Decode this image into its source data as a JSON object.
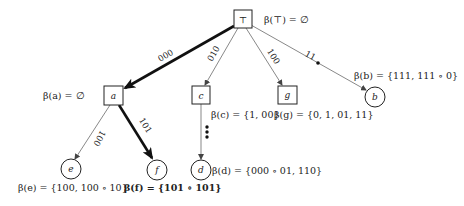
{
  "diagram": {
    "type": "tree",
    "colors": {
      "stroke": "#222222",
      "thin_edge": "#555555",
      "background": "#ffffff"
    },
    "nodes": [
      {
        "id": "top",
        "label": "⊤",
        "shape": "square",
        "annotation": "β(⊤) = ∅"
      },
      {
        "id": "a",
        "label": "a",
        "shape": "square",
        "annotation": "β(a) = ∅"
      },
      {
        "id": "c",
        "label": "c",
        "shape": "square",
        "annotation": "β(c) = {1, 00}"
      },
      {
        "id": "g",
        "label": "g",
        "shape": "square",
        "annotation": "β(g) = {0, 1, 01, 11}"
      },
      {
        "id": "b",
        "label": "b",
        "shape": "circle",
        "annotation": "β(b) = {111, 111 ∘ 0}"
      },
      {
        "id": "e",
        "label": "e",
        "shape": "circle",
        "annotation": "β(e) = {100, 100 ∘ 10}"
      },
      {
        "id": "f",
        "label": "f",
        "shape": "circle",
        "annotation": "β(f) = {101 ∘ 101}"
      },
      {
        "id": "d",
        "label": "d",
        "shape": "circle",
        "annotation": "β(d) = {000 ∘ 01, 110}"
      }
    ],
    "edges": [
      {
        "from": "top",
        "to": "a",
        "label": "000",
        "bold": true
      },
      {
        "from": "top",
        "to": "c",
        "label": "010",
        "bold": false
      },
      {
        "from": "top",
        "to": "g",
        "label": "100",
        "bold": false
      },
      {
        "from": "top",
        "to": "b",
        "label": "11",
        "bold": false,
        "dot": true
      },
      {
        "from": "a",
        "to": "e",
        "label": "100",
        "bold": false
      },
      {
        "from": "a",
        "to": "f",
        "label": "101",
        "bold": true
      },
      {
        "from": "c",
        "to": "d",
        "label": "⋮",
        "bold": false,
        "dotted": true
      }
    ]
  }
}
